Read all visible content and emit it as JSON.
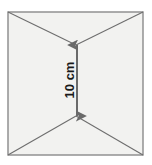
{
  "figure": {
    "background_color": "#ffffff",
    "square": {
      "fill_color": "#f2f2f0",
      "stroke_color": "#8a8a8a",
      "stroke_width": 1.4,
      "left": 8,
      "top": 12,
      "right": 143,
      "bottom": 155
    },
    "diagonals": {
      "stroke_color": "#6e6e6e",
      "stroke_width": 1.1,
      "upper_vertex": {
        "x": 76,
        "y": 45
      },
      "lower_vertex": {
        "x": 76,
        "y": 116
      },
      "lines": [
        {
          "name": "top-left-to-upper-vertex",
          "x1": 8,
          "y1": 12,
          "x2": 76,
          "y2": 45
        },
        {
          "name": "top-right-to-upper-vertex",
          "x1": 143,
          "y1": 12,
          "x2": 76,
          "y2": 45
        },
        {
          "name": "bottom-left-to-lower-vertex",
          "x1": 8,
          "y1": 155,
          "x2": 76,
          "y2": 116
        },
        {
          "name": "bottom-right-to-lower-vertex",
          "x1": 143,
          "y1": 155,
          "x2": 76,
          "y2": 116
        }
      ]
    },
    "dimension": {
      "label": "10 cm",
      "value": 10,
      "unit": "cm",
      "orientation": "vertical",
      "text_rotation_deg": -90,
      "text_color": "#1a1a1a",
      "arrow_color": "#6a6a6a",
      "arrow_stroke_width": 2.0,
      "arrow_x": 77,
      "arrow_top_y": 45,
      "arrow_bottom_y": 116,
      "label_x": 71,
      "label_center_y": 80,
      "double_headed": true
    }
  }
}
